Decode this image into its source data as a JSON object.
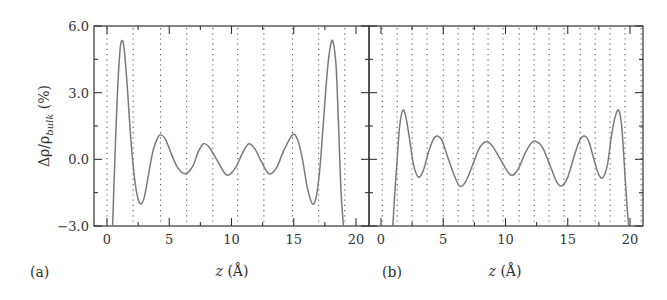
{
  "chart_data": [
    {
      "panel": "(a)",
      "type": "line",
      "title": "",
      "xlabel": "z (Å)",
      "ylabel": "Δρ/ρbulk (%)",
      "xlim": [
        -0.6,
        21.5
      ],
      "ylim": [
        -3.0,
        6.0
      ],
      "xticks": [
        0,
        5,
        10,
        15,
        20
      ],
      "yticks": [
        -3.0,
        0.0,
        3.0,
        6.0
      ],
      "yticklabels": [
        "−3.0",
        "0.0",
        "3.0",
        "6.0"
      ],
      "dotted_vlines": [
        0.0,
        2.1,
        4.3,
        6.4,
        8.5,
        10.5,
        12.6,
        14.9,
        17.0,
        19.1
      ],
      "series": [
        {
          "name": "density deviation",
          "x": [
            0.45,
            0.6,
            0.8,
            1.0,
            1.15,
            1.35,
            1.6,
            1.9,
            2.2,
            2.5,
            2.75,
            3.0,
            3.3,
            3.7,
            4.1,
            4.35,
            4.7,
            5.2,
            5.7,
            6.3,
            6.9,
            7.3,
            7.75,
            8.2,
            8.8,
            9.6,
            10.3,
            10.9,
            11.4,
            11.9,
            12.4,
            13.0,
            13.6,
            14.2,
            14.9,
            15.3,
            15.7,
            16.1,
            16.5,
            16.8,
            17.1,
            17.4,
            17.7,
            17.95,
            18.15,
            18.4,
            18.6,
            18.8,
            19.0
          ],
          "y": [
            -3.0,
            -0.5,
            2.5,
            4.6,
            5.3,
            5.1,
            3.5,
            1.0,
            -0.8,
            -1.8,
            -2.0,
            -1.7,
            -0.8,
            0.4,
            1.0,
            1.1,
            0.9,
            0.2,
            -0.4,
            -0.65,
            -0.3,
            0.3,
            0.7,
            0.55,
            0.0,
            -0.7,
            -0.4,
            0.3,
            0.7,
            0.45,
            -0.1,
            -0.65,
            -0.4,
            0.4,
            1.1,
            0.9,
            0.0,
            -1.3,
            -2.0,
            -1.7,
            -0.4,
            1.8,
            4.0,
            5.1,
            5.3,
            4.2,
            1.5,
            -1.5,
            -3.0
          ]
        }
      ]
    },
    {
      "panel": "(b)",
      "type": "line",
      "title": "",
      "xlabel": "z (Å)",
      "ylabel": "Δρ/ρbulk (%)",
      "xlim": [
        -0.6,
        21.0
      ],
      "ylim": [
        -3.0,
        6.0
      ],
      "xticks": [
        0,
        5,
        10,
        15,
        20
      ],
      "yticks": [
        -3.0,
        0.0,
        3.0,
        6.0
      ],
      "dotted_vlines": [
        0.1,
        1.3,
        2.5,
        3.7,
        5.0,
        6.2,
        7.4,
        8.6,
        9.8,
        11.1,
        12.3,
        13.5,
        14.7,
        16.0,
        17.2,
        18.4,
        19.6,
        20.9
      ],
      "series": [
        {
          "name": "density deviation",
          "x": [
            0.95,
            1.1,
            1.3,
            1.5,
            1.75,
            2.0,
            2.3,
            2.6,
            3.0,
            3.4,
            3.8,
            4.2,
            4.55,
            4.9,
            5.3,
            5.8,
            6.3,
            6.8,
            7.4,
            7.9,
            8.5,
            9.0,
            9.6,
            10.4,
            11.0,
            11.6,
            12.1,
            12.5,
            13.0,
            13.6,
            14.1,
            14.5,
            15.0,
            15.6,
            16.0,
            16.35,
            16.7,
            17.1,
            17.5,
            17.85,
            18.2,
            18.5,
            18.8,
            19.1,
            19.35,
            19.55,
            19.75,
            19.9
          ],
          "y": [
            -3.0,
            -1.6,
            0.0,
            1.5,
            2.2,
            1.9,
            0.9,
            -0.2,
            -0.8,
            -0.5,
            0.3,
            0.9,
            1.05,
            0.85,
            0.2,
            -0.6,
            -1.2,
            -1.0,
            -0.2,
            0.5,
            0.8,
            0.55,
            0.0,
            -0.7,
            -0.45,
            0.3,
            0.75,
            0.8,
            0.5,
            -0.3,
            -1.0,
            -1.2,
            -0.8,
            0.3,
            0.9,
            1.05,
            0.8,
            0.0,
            -0.7,
            -0.8,
            -0.2,
            1.0,
            1.9,
            2.2,
            1.4,
            -0.3,
            -2.0,
            -3.0
          ]
        }
      ]
    }
  ],
  "labels": {
    "ylabel_main": "Δρ/ρ",
    "ylabel_sub": "bulk",
    "ylabel_unit": " (%)",
    "xlabel_var": "z",
    "xlabel_unit": " (Å)",
    "panel_a": "(a)",
    "panel_b": "(b)"
  },
  "colors": {
    "frame": "#333333",
    "curve": "#7a7a7a",
    "dots": "#555555",
    "text": "#333333"
  }
}
